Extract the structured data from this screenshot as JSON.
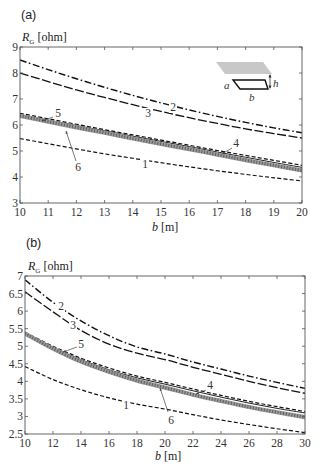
{
  "figure": {
    "panels": [
      {
        "label": "(a)"
      },
      {
        "label": "(b)"
      }
    ]
  },
  "inset": {
    "a": "a",
    "b": "b",
    "h": "h"
  },
  "chart_data": [
    {
      "type": "line",
      "title": "(a)",
      "xlabel": "b [m]",
      "ylabel": "R_G [ohm]",
      "xlabel_parts": {
        "symbol": "b",
        "unit": " [m]"
      },
      "ylabel_parts": {
        "symbol": "R",
        "subscript": "G",
        "unit": " [ohm]"
      },
      "xlim": [
        10,
        20
      ],
      "ylim": [
        3,
        9
      ],
      "xticks": [
        "10",
        "11",
        "12",
        "13",
        "14",
        "15",
        "16",
        "17",
        "18",
        "19",
        "20"
      ],
      "yticks": [
        "3",
        "4",
        "5",
        "6",
        "7",
        "8",
        "9"
      ],
      "grid": false,
      "legend": "inline curve numbers 1-6",
      "x": [
        10,
        11,
        12,
        13,
        14,
        15,
        16,
        17,
        18,
        19,
        20
      ],
      "series": [
        {
          "name": "1",
          "style": "dashed",
          "values": [
            5.48,
            5.28,
            5.08,
            4.89,
            4.72,
            4.55,
            4.39,
            4.24,
            4.1,
            3.97,
            3.85
          ]
        },
        {
          "name": "2",
          "style": "dash-dot",
          "values": [
            8.5,
            8.13,
            7.78,
            7.45,
            7.14,
            6.85,
            6.58,
            6.33,
            6.1,
            5.89,
            5.7
          ]
        },
        {
          "name": "3",
          "style": "long-dash",
          "values": [
            8.0,
            7.67,
            7.35,
            7.06,
            6.78,
            6.52,
            6.28,
            6.06,
            5.85,
            5.67,
            5.5
          ]
        },
        {
          "name": "4",
          "style": "dashed",
          "values": [
            6.45,
            6.24,
            6.03,
            5.82,
            5.62,
            5.42,
            5.22,
            5.02,
            4.83,
            4.64,
            4.45
          ]
        },
        {
          "name": "5",
          "style": "solid",
          "values": [
            6.4,
            6.19,
            5.98,
            5.78,
            5.57,
            5.37,
            5.17,
            4.96,
            4.76,
            4.56,
            4.37
          ]
        },
        {
          "name": "6",
          "style": "thick-hatched-gray",
          "values": [
            6.35,
            6.13,
            5.91,
            5.7,
            5.48,
            5.27,
            5.07,
            4.86,
            4.65,
            4.45,
            4.25
          ]
        }
      ]
    },
    {
      "type": "line",
      "title": "(b)",
      "xlabel": "b [m]",
      "ylabel": "R_G [ohm]",
      "xlabel_parts": {
        "symbol": "b",
        "unit": " [m]"
      },
      "ylabel_parts": {
        "symbol": "R",
        "subscript": "G",
        "unit": " [ohm]"
      },
      "xlim": [
        10,
        30
      ],
      "ylim": [
        2.5,
        7
      ],
      "xticks": [
        "10",
        "12",
        "14",
        "16",
        "18",
        "20",
        "22",
        "24",
        "26",
        "28",
        "30"
      ],
      "yticks": [
        "2.5",
        "3",
        "3.5",
        "4",
        "4.5",
        "5",
        "5.5",
        "6",
        "6.5",
        "7"
      ],
      "grid": false,
      "legend": "inline curve numbers 1-6",
      "x": [
        10,
        12,
        14,
        16,
        18,
        20,
        22,
        24,
        26,
        28,
        30
      ],
      "series": [
        {
          "name": "1",
          "style": "dashed",
          "values": [
            4.42,
            4.05,
            3.76,
            3.53,
            3.35,
            3.21,
            3.05,
            2.9,
            2.77,
            2.65,
            2.54
          ]
        },
        {
          "name": "2",
          "style": "dash-dot",
          "values": [
            6.89,
            6.25,
            5.72,
            5.3,
            4.98,
            4.78,
            4.55,
            4.35,
            4.15,
            3.97,
            3.8
          ]
        },
        {
          "name": "3",
          "style": "long-dash",
          "values": [
            6.55,
            5.98,
            5.45,
            5.06,
            4.8,
            4.62,
            4.4,
            4.2,
            4.0,
            3.82,
            3.66
          ]
        },
        {
          "name": "4",
          "style": "dashed",
          "values": [
            5.4,
            5.0,
            4.66,
            4.38,
            4.15,
            3.97,
            3.78,
            3.6,
            3.43,
            3.28,
            3.14
          ]
        },
        {
          "name": "5",
          "style": "solid",
          "values": [
            5.38,
            4.97,
            4.62,
            4.33,
            4.1,
            3.92,
            3.73,
            3.55,
            3.38,
            3.23,
            3.1
          ]
        },
        {
          "name": "6",
          "style": "thick-hatched-gray",
          "values": [
            5.36,
            4.93,
            4.56,
            4.27,
            4.02,
            3.82,
            3.62,
            3.44,
            3.27,
            3.12,
            2.98
          ]
        }
      ]
    }
  ]
}
